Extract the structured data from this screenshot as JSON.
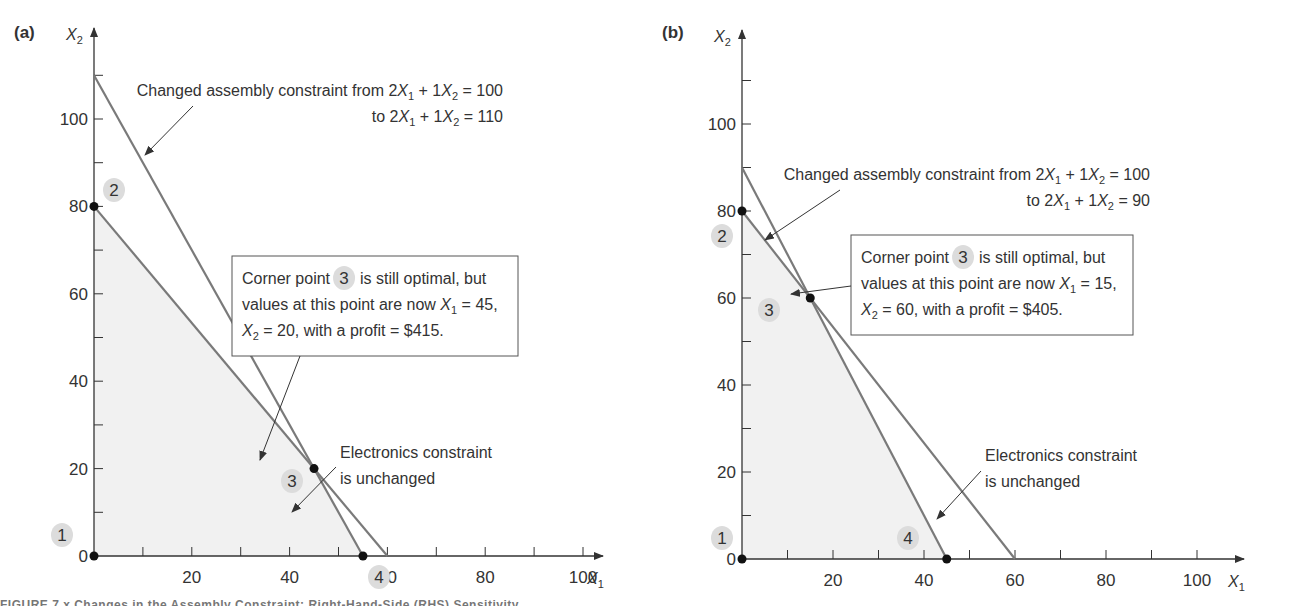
{
  "caption": "FIGURE 7.x   Changes in the Assembly Constraint: Right-Hand-Side (RHS) Sensitivity",
  "colors": {
    "line": "#7a7a7a",
    "axis": "#333333",
    "feasible_fill": "#f1f1f1",
    "badge": "#dcdcdc",
    "point": "#111111"
  },
  "chart_data": [
    {
      "panel": "(a)",
      "type": "line",
      "xlabel": "X1",
      "ylabel": "X2",
      "xlim": [
        0,
        100
      ],
      "ylim": [
        0,
        110
      ],
      "x_ticks": [
        20,
        40,
        60,
        80,
        100
      ],
      "y_ticks": [
        0,
        20,
        40,
        60,
        80,
        100
      ],
      "minor_tick_step": 10,
      "series": [
        {
          "name": "Electronics constraint (unchanged)",
          "points": [
            [
              0,
              80
            ],
            [
              60,
              0
            ]
          ]
        },
        {
          "name": "Assembly constraint 2X1 + 1X2 = 110",
          "points": [
            [
              0,
              110
            ],
            [
              55,
              0
            ]
          ]
        }
      ],
      "feasible_region": [
        [
          0,
          0
        ],
        [
          0,
          80
        ],
        [
          45,
          20
        ],
        [
          55,
          0
        ]
      ],
      "corner_points": [
        {
          "id": "1",
          "x": 0,
          "y": 0
        },
        {
          "id": "2",
          "x": 0,
          "y": 80
        },
        {
          "id": "3",
          "x": 45,
          "y": 20
        },
        {
          "id": "4",
          "x": 55,
          "y": 0
        }
      ],
      "annotations": {
        "changed_line1_prefix": "Changed assembly constraint from 2",
        "changed_line2_prefix": "to 2",
        "changed_rhs_old": "100",
        "changed_rhs_new": "110",
        "box_line1_a": "Corner point",
        "box_line1_badge": "3",
        "box_line1_b": "is still optimal, but",
        "box_line2": "values at this point are now",
        "box_x1_value": "45",
        "box_x2_value": "20",
        "box_profit": "$415",
        "electronics_line1": "Electronics constraint",
        "electronics_line2": "is unchanged"
      }
    },
    {
      "panel": "(b)",
      "type": "line",
      "xlabel": "X1",
      "ylabel": "X2",
      "xlim": [
        0,
        100
      ],
      "ylim": [
        0,
        110
      ],
      "x_ticks": [
        20,
        40,
        60,
        80,
        100
      ],
      "y_ticks": [
        0,
        20,
        40,
        60,
        80,
        100
      ],
      "minor_tick_step": 10,
      "series": [
        {
          "name": "Electronics constraint (unchanged)",
          "points": [
            [
              0,
              80
            ],
            [
              60,
              0
            ]
          ]
        },
        {
          "name": "Assembly constraint 2X1 + 1X2 = 90",
          "points": [
            [
              0,
              90
            ],
            [
              45,
              0
            ]
          ]
        }
      ],
      "feasible_region": [
        [
          0,
          0
        ],
        [
          0,
          80
        ],
        [
          15,
          60
        ],
        [
          45,
          0
        ]
      ],
      "corner_points": [
        {
          "id": "1",
          "x": 0,
          "y": 0
        },
        {
          "id": "2",
          "x": 0,
          "y": 80
        },
        {
          "id": "3",
          "x": 15,
          "y": 60
        },
        {
          "id": "4",
          "x": 45,
          "y": 0
        }
      ],
      "annotations": {
        "changed_line1_prefix": "Changed assembly constraint from 2",
        "changed_line2_prefix": "to 2",
        "changed_rhs_old": "100",
        "changed_rhs_new": "90",
        "box_line1_a": "Corner point",
        "box_line1_badge": "3",
        "box_line1_b": "is still optimal, but",
        "box_line2": "values at this point are now",
        "box_x1_value": "15",
        "box_x2_value": "60",
        "box_profit": "$405",
        "electronics_line1": "Electronics constraint",
        "electronics_line2": "is unchanged"
      }
    }
  ]
}
